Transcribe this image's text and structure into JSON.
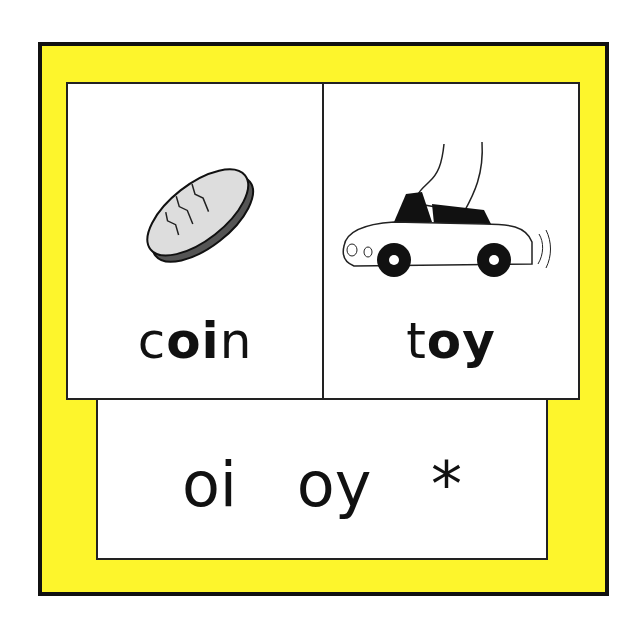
{
  "cards": [
    {
      "word_parts": [
        {
          "text": "c",
          "bold": false
        },
        {
          "text": "oi",
          "bold": true
        },
        {
          "text": "n",
          "bold": false
        }
      ],
      "picture": "coin-icon",
      "word": "coin"
    },
    {
      "word_parts": [
        {
          "text": "t",
          "bold": false
        },
        {
          "text": "oy",
          "bold": true
        }
      ],
      "picture": "toy-car-icon",
      "word": "toy"
    }
  ],
  "sounds": {
    "label": "oi  oy  *",
    "items": [
      "oi",
      "oy",
      "*"
    ]
  },
  "colors": {
    "frame": "#fdf52c",
    "border": "#111111",
    "card": "#ffffff"
  }
}
